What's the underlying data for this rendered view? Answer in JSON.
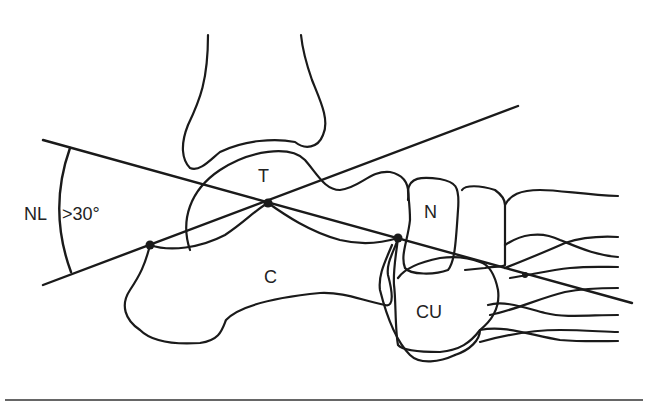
{
  "figure": {
    "labels": {
      "talus": "T",
      "calcaneus": "C",
      "navicular": "N",
      "cuboid": "CU",
      "angle_name": "NL",
      "angle_value": ">30°"
    },
    "stroke_color": "#1a1a1a",
    "background": "#ffffff"
  }
}
